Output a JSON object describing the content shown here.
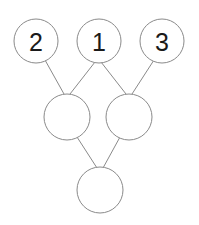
{
  "diagram": {
    "type": "node-link-tree",
    "title": "",
    "background_color": "#ffffff",
    "node_fill_color": "#ffffff",
    "node_stroke_color": "#8a8a8a",
    "edge_color": "#8a8a8a",
    "label_color": "#1a1a1a",
    "stroke_width": 1,
    "rows": [
      {
        "name": "top-row",
        "nodes": [
          {
            "id": "top-left",
            "label": "2",
            "cx": 36,
            "cy": 41,
            "r": 22
          },
          {
            "id": "top-middle",
            "label": "1",
            "cx": 99,
            "cy": 41,
            "r": 22
          },
          {
            "id": "top-right",
            "label": "3",
            "cx": 162,
            "cy": 41,
            "r": 22
          }
        ]
      },
      {
        "name": "middle-row",
        "nodes": [
          {
            "id": "mid-left",
            "label": "",
            "cx": 67,
            "cy": 117,
            "r": 23
          },
          {
            "id": "mid-right",
            "label": "",
            "cx": 129,
            "cy": 117,
            "r": 23
          }
        ]
      },
      {
        "name": "bottom-row",
        "nodes": [
          {
            "id": "bottom",
            "label": "",
            "cx": 100,
            "cy": 190,
            "r": 23
          }
        ]
      }
    ],
    "edges": [
      {
        "id": "edge-2-to-midleft",
        "from": "top-left",
        "to": "mid-left",
        "x1": 45,
        "y1": 60,
        "x2": 64,
        "y2": 94
      },
      {
        "id": "edge-1-to-midleft",
        "from": "top-middle",
        "to": "mid-left",
        "x1": 95,
        "y1": 62,
        "x2": 70,
        "y2": 94
      },
      {
        "id": "edge-1-to-midright",
        "from": "top-middle",
        "to": "mid-right",
        "x1": 101,
        "y1": 62,
        "x2": 126,
        "y2": 94
      },
      {
        "id": "edge-3-to-midright",
        "from": "top-right",
        "to": "mid-right",
        "x1": 154,
        "y1": 60,
        "x2": 132,
        "y2": 94
      },
      {
        "id": "edge-midleft-to-bottom",
        "from": "mid-left",
        "to": "bottom",
        "x1": 77,
        "y1": 137,
        "x2": 97,
        "y2": 168
      },
      {
        "id": "edge-midright-to-bottom",
        "from": "mid-right",
        "to": "bottom",
        "x1": 120,
        "y1": 137,
        "x2": 103,
        "y2": 168
      }
    ]
  }
}
